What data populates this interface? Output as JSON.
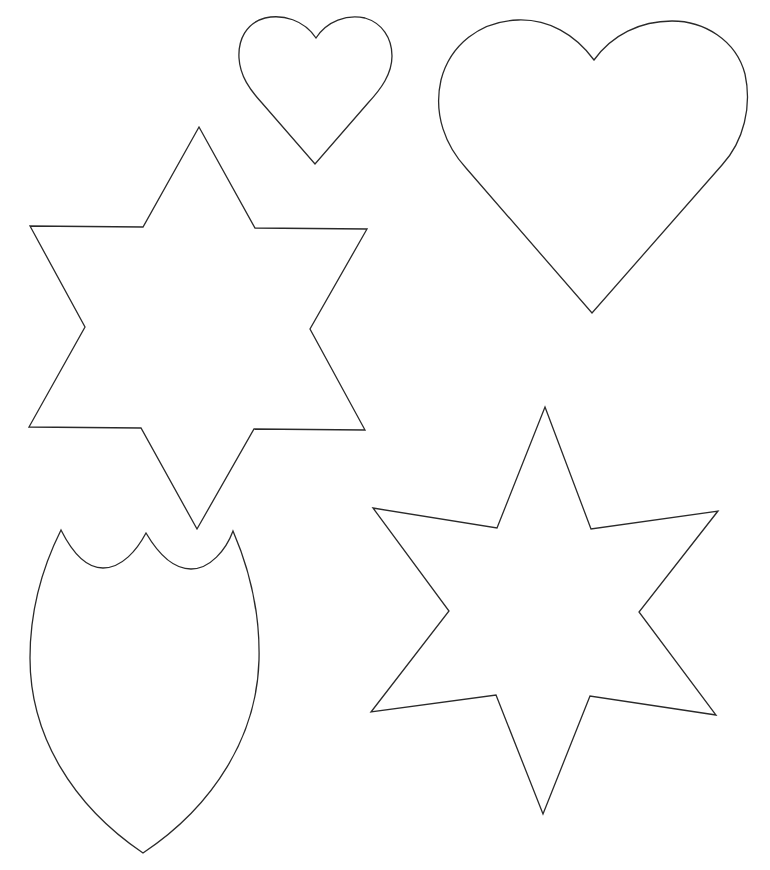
{
  "page": {
    "background": "#ffffff",
    "stroke_color": "#2a2a2a",
    "width": 770,
    "height": 870
  },
  "shapes": [
    {
      "id": "small-heart",
      "type": "heart",
      "label": "small heart outline",
      "bbox": {
        "left": 239,
        "top": 17,
        "right": 392,
        "bottom": 164
      },
      "path": "M316 38 C 304 20, 283 14, 265 18 C 246 23, 238 40, 239 58 C 240 76, 250 90, 262 103 L 315 164 L 368 103 C 381 89, 392 74, 392 56 C 392 38, 382 23, 365 18 C 347 14, 327 21, 316 38 Z"
    },
    {
      "id": "large-heart",
      "type": "heart",
      "label": "large heart outline",
      "bbox": {
        "left": 438,
        "top": 20,
        "right": 748,
        "bottom": 313
      },
      "path": "M594 60 C 575 34, 548 19, 518 20 C 480 21, 450 45, 441 80 C 433 115, 446 146, 466 168 L 592 313 L 722 165 C 744 141, 752 106, 745 74 C 736 40, 704 21, 672 21 C 640 21, 612 35, 594 60 Z"
    },
    {
      "id": "six-point-star-left",
      "type": "star",
      "label": "six-pointed star (left)",
      "points": [
        [
          199,
          127
        ],
        [
          255,
          228
        ],
        [
          367,
          229
        ],
        [
          310,
          329
        ],
        [
          365,
          430
        ],
        [
          254,
          429
        ],
        [
          197,
          529
        ],
        [
          141,
          428
        ],
        [
          29,
          427
        ],
        [
          85,
          327
        ],
        [
          30,
          226
        ],
        [
          143,
          227
        ]
      ]
    },
    {
      "id": "shield",
      "type": "shield",
      "label": "shield outline with scalloped top",
      "bbox": {
        "left": 30,
        "top": 530,
        "right": 259,
        "bottom": 853
      },
      "path": "M61 530 C 72 552, 86 568, 103 568 C 122 568, 137 550, 146 533 C 156 550, 171 569, 191 569 C 210 569, 226 550, 233 531 C 252 575, 260 620, 259 660 C 257 735, 215 805, 143 853 C 72 805, 30 735, 30 658 C 30 612, 42 568, 61 530 Z"
    },
    {
      "id": "six-point-star-right",
      "type": "star",
      "label": "six-pointed star (right)",
      "points": [
        [
          545,
          407
        ],
        [
          591,
          529
        ],
        [
          718,
          511
        ],
        [
          639,
          612
        ],
        [
          716,
          715
        ],
        [
          590,
          696
        ],
        [
          543,
          814
        ],
        [
          496,
          695
        ],
        [
          371,
          712
        ],
        [
          449,
          611
        ],
        [
          373,
          508
        ],
        [
          497,
          528
        ]
      ]
    }
  ]
}
